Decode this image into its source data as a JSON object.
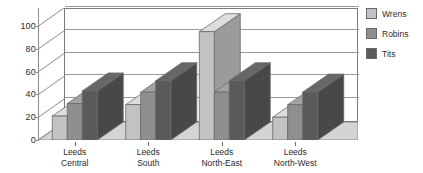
{
  "chart_data": {
    "type": "bar",
    "title": "",
    "subtitle": "",
    "xlabel": "",
    "ylabel": "",
    "ylim": [
      0,
      100
    ],
    "yticks": [
      0,
      20,
      40,
      60,
      80,
      100
    ],
    "grid": true,
    "legend_position": "right",
    "style": "3d-grouped-bar",
    "categories": [
      "Leeds Central",
      "Leeds South",
      "Leeds North-East",
      "Leeds North-West"
    ],
    "category_lines": [
      [
        "Leeds",
        "Central"
      ],
      [
        "Leeds",
        "South"
      ],
      [
        "Leeds",
        "North-East"
      ],
      [
        "Leeds",
        "North-West"
      ]
    ],
    "series": [
      {
        "name": "Wrens",
        "color": "#c2c2c2",
        "values": [
          21,
          31,
          95,
          20
        ]
      },
      {
        "name": "Robins",
        "color": "#8f8f8f",
        "values": [
          32,
          42,
          42,
          31
        ]
      },
      {
        "name": "Tits",
        "color": "#5a5a5a",
        "values": [
          43,
          52,
          52,
          42
        ]
      }
    ]
  },
  "legend": {
    "items": [
      {
        "label": "Wrens",
        "color": "#c2c2c2"
      },
      {
        "label": "Robins",
        "color": "#8f8f8f"
      },
      {
        "label": "Tits",
        "color": "#5a5a5a"
      }
    ]
  },
  "axes": {
    "y_tick_labels": [
      "100",
      "80",
      "60",
      "40",
      "20",
      "0"
    ]
  },
  "colors": {
    "floor": "#d4d4d4",
    "wall_line": "#8c8c8c",
    "grid": "#9a9a9a",
    "text": "#2b2b2b",
    "background": "#ffffff"
  }
}
